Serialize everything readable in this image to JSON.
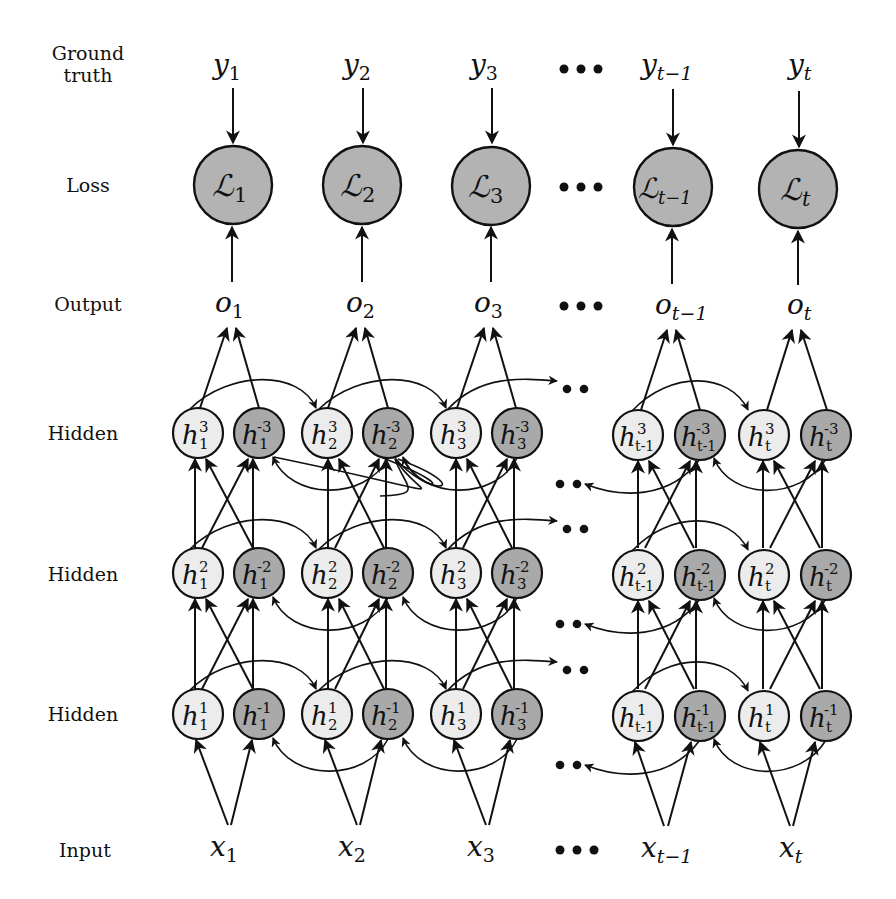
{
  "diagram": {
    "type": "bidirectional-deep-rnn-unrolled",
    "row_labels": {
      "ground_truth_line1": "Ground",
      "ground_truth_line2": "truth",
      "loss": "Loss",
      "output": "Output",
      "hidden_3": "Hidden",
      "hidden_2": "Hidden",
      "hidden_1": "Hidden",
      "input": "Input"
    },
    "ellipsis": "•••",
    "ellipsis_short": "••",
    "columns": [
      {
        "index": "1",
        "y": "y",
        "y_sub": "1",
        "loss": "ℒ",
        "loss_sub": "1",
        "o": "o",
        "o_sub": "1",
        "x": "x",
        "x_sub": "1",
        "h_sub": "1"
      },
      {
        "index": "2",
        "y": "y",
        "y_sub": "2",
        "loss": "ℒ",
        "loss_sub": "2",
        "o": "o",
        "o_sub": "2",
        "x": "x",
        "x_sub": "2",
        "h_sub": "2"
      },
      {
        "index": "3",
        "y": "y",
        "y_sub": "3",
        "loss": "ℒ",
        "loss_sub": "3",
        "o": "o",
        "o_sub": "3",
        "x": "x",
        "x_sub": "3",
        "h_sub": "3"
      },
      {
        "index": "t-1",
        "y": "y",
        "y_sub": "t−1",
        "loss": "ℒ",
        "loss_sub": "t−1",
        "o": "o",
        "o_sub": "t−1",
        "x": "x",
        "x_sub": "t−1",
        "h_sub": "t-1"
      },
      {
        "index": "t",
        "y": "y",
        "y_sub": "t",
        "loss": "ℒ",
        "loss_sub": "t",
        "o": "o",
        "o_sub": "t",
        "x": "x",
        "x_sub": "t",
        "h_sub": "t"
      }
    ],
    "hidden_layers": [
      {
        "layer": "3",
        "fwd_sup": "3",
        "bwd_sup": "-3"
      },
      {
        "layer": "2",
        "fwd_sup": "2",
        "bwd_sup": "-2"
      },
      {
        "layer": "1",
        "fwd_sup": "1",
        "bwd_sup": "-1"
      }
    ],
    "node_symbol": "h",
    "colors": {
      "forward_node": "#ececec",
      "backward_node": "#a9a9a9",
      "loss_node": "#b3b3b3",
      "stroke": "#111111"
    }
  }
}
